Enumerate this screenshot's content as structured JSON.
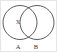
{
  "figure": {
    "kind": "venn-diagram",
    "background_color": "#ffffff",
    "border_color": "#e6e6e6",
    "stroke_color": "#4a4a4a",
    "text_color": "#2e2e2e",
    "width": 57,
    "height": 52
  },
  "circles": [
    {
      "id": "A",
      "label": "A",
      "cx": 19,
      "cy": 21.5,
      "r": 17,
      "label_x": 17,
      "label_y": 48
    },
    {
      "id": "B",
      "label": "B",
      "cx": 36,
      "cy": 21.5,
      "r": 17,
      "label_x": 35,
      "label_y": 48
    }
  ],
  "points": [
    {
      "id": "x-point",
      "label": "X",
      "x": 17,
      "y": 23,
      "region": "A-only"
    }
  ]
}
